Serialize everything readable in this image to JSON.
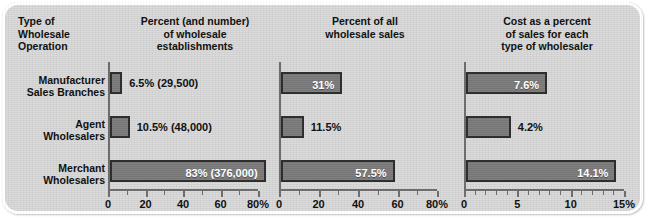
{
  "card": {
    "background_color": "#d2d2d2",
    "bar_color": "#767676",
    "bar_border_color": "#2e2e2e",
    "axis_color": "#6d6d6d",
    "text_color": "#111111"
  },
  "headers": {
    "col0": "Type of\nWholesale\nOperation",
    "col1": "Percent (and number)\nof wholesale\nestablishments",
    "col2": "Percent of all\nwholesale sales",
    "col3": "Cost as a percent\nof sales for each\ntype of wholesaler"
  },
  "rows": [
    {
      "label": "Manufacturer\nSales Branches"
    },
    {
      "label": "Agent\nWholesalers"
    },
    {
      "label": "Merchant\nWholesalers"
    }
  ],
  "chart_data": [
    {
      "type": "bar",
      "orientation": "horizontal",
      "title": "Percent (and number) of wholesale establishments",
      "xlabel": "",
      "ylabel": "",
      "categories": [
        "Manufacturer Sales Branches",
        "Agent Wholesalers",
        "Merchant Wholesalers"
      ],
      "values": [
        6.5,
        10.5,
        83
      ],
      "data_labels": [
        "6.5% (29,500)",
        "10.5% (48,000)",
        "83% (376,000)"
      ],
      "counts": [
        29500,
        48000,
        376000
      ],
      "xlim": [
        0,
        80
      ],
      "ticks": [
        0,
        20,
        40,
        60,
        80
      ],
      "tick_labels": [
        "0",
        "20",
        "40",
        "60",
        "80%"
      ],
      "minor_tick_step": 10,
      "grid": false,
      "legend": "none"
    },
    {
      "type": "bar",
      "orientation": "horizontal",
      "title": "Percent of all wholesale sales",
      "xlabel": "",
      "ylabel": "",
      "categories": [
        "Manufacturer Sales Branches",
        "Agent Wholesalers",
        "Merchant Wholesalers"
      ],
      "values": [
        31,
        11.5,
        57.5
      ],
      "data_labels": [
        "31%",
        "11.5%",
        "57.5%"
      ],
      "xlim": [
        0,
        80
      ],
      "ticks": [
        0,
        20,
        40,
        60,
        80
      ],
      "tick_labels": [
        "0",
        "20",
        "40",
        "60",
        "80%"
      ],
      "minor_tick_step": 10,
      "grid": false,
      "legend": "none"
    },
    {
      "type": "bar",
      "orientation": "horizontal",
      "title": "Cost as a percent of sales for each type of wholesaler",
      "xlabel": "",
      "ylabel": "",
      "categories": [
        "Manufacturer Sales Branches",
        "Agent Wholesalers",
        "Merchant Wholesalers"
      ],
      "values": [
        7.6,
        4.2,
        14.1
      ],
      "data_labels": [
        "7.6%",
        "4.2%",
        "14.1%"
      ],
      "xlim": [
        0,
        15
      ],
      "ticks": [
        0,
        5,
        10,
        15
      ],
      "tick_labels": [
        "0",
        "5",
        "10",
        "15%"
      ],
      "minor_tick_step": 1,
      "grid": false,
      "legend": "none"
    }
  ]
}
